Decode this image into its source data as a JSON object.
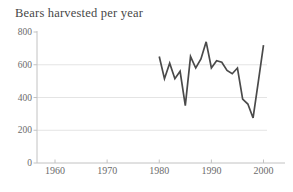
{
  "page": {
    "background": "#ffffff"
  },
  "chart_data": {
    "type": "line",
    "title": "Bears harvested per year",
    "series": [
      {
        "name": "Bears harvested",
        "x": [
          1980,
          1981,
          1982,
          1983,
          1984,
          1985,
          1986,
          1987,
          1988,
          1989,
          1990,
          1991,
          1992,
          1993,
          1994,
          1995,
          1996,
          1997,
          1998,
          1999,
          2000
        ],
        "values": [
          650,
          515,
          610,
          515,
          560,
          350,
          650,
          580,
          635,
          740,
          580,
          625,
          615,
          565,
          545,
          580,
          390,
          360,
          275,
          495,
          720
        ]
      }
    ],
    "xlabel": "",
    "ylabel": "",
    "xlim": [
      1956.5,
      2004
    ],
    "ylim": [
      0,
      800
    ],
    "x_ticks": [
      1960,
      1970,
      1980,
      1990,
      2000
    ],
    "y_ticks": [
      0,
      200,
      400,
      600,
      800
    ],
    "gridlines_y": [
      200,
      400,
      600
    ],
    "grid": "horizontal-light",
    "legend": "none",
    "colors": {
      "line": "#4a4a4a",
      "axis": "#c2c2c2",
      "gridline": "#e4e4e4",
      "tick_label": "#6b6b6b",
      "title": "#474747"
    }
  }
}
